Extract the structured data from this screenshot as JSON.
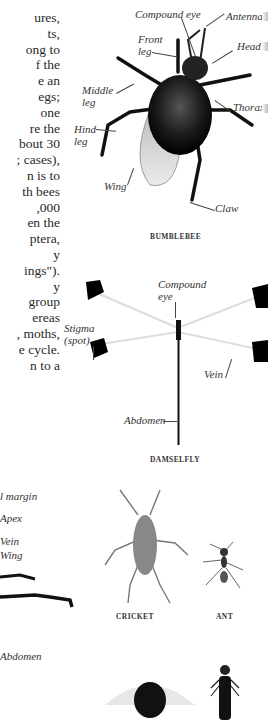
{
  "page": {
    "body_text_lines": [
      "ures,",
      "ts,",
      "ong to",
      "f the",
      "e an",
      "egs;",
      "one",
      "re the",
      "bout 30",
      "; cases),",
      "n is to",
      "th bees",
      ",000",
      "en the",
      "ptera,",
      "y",
      "ings\").",
      "y",
      "group",
      "ereas",
      ", moths,",
      "e cycle.",
      "n to a"
    ]
  },
  "bumblebee": {
    "caption": "BUMBLEBEE",
    "labels": {
      "compound_eye": "Compound eye",
      "antenna": "Antenna",
      "front_leg": "Front leg",
      "front_leg_l1": "Front",
      "front_leg_l2": "leg",
      "head": "Head",
      "middle_leg_l1": "Middle",
      "middle_leg_l2": "leg",
      "thorax": "Thorax",
      "hind_leg_l1": "Hind",
      "hind_leg_l2": "leg",
      "wing": "Wing",
      "claw": "Claw"
    }
  },
  "damselfly": {
    "caption": "DAMSELFLY",
    "labels": {
      "compound_eye_l1": "Compound",
      "compound_eye_l2": "eye",
      "stigma_l1": "Stigma",
      "stigma_l2": "(spot)",
      "vein": "Vein",
      "abdomen": "Abdomen"
    }
  },
  "left_insect": {
    "labels": {
      "margin": "l margin",
      "apex": "Apex",
      "vein": "Vein",
      "wing": "Wing",
      "abdomen": "Abdomen"
    }
  },
  "small_specimens": [
    {
      "caption": "CRICKET"
    },
    {
      "caption": "ANT"
    }
  ]
}
